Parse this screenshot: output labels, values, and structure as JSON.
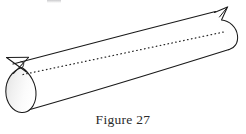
{
  "figure": {
    "caption": "Figure 27",
    "caption_number": "27",
    "caption_label": "Figure",
    "background_color": "#ffffff",
    "stroke_color": "#1a1a1a",
    "dotted_stroke_color": "#2a2a2a",
    "end_cap_fill_light": "#ffffff",
    "end_cap_fill_shade": "#e8e8e8",
    "elements": {
      "top_edge": "top-slant-line",
      "bottom_edge": "bottom-slant-line",
      "axis": "dotted-center-axis",
      "near_end": "shaded-teardrop-end-cap",
      "far_end": "curved-far-end-cap",
      "near_cusp": "left-bowtie-cusp",
      "far_cusp": "right-bowtie-cusp"
    }
  },
  "geometry": {
    "top_edge_start": "11,64",
    "top_edge_end": "226,8",
    "bottom_edge_start": "22,112",
    "bottom_edge_end": "237,47",
    "axis_start": "24,75",
    "axis_end": "227,33",
    "near_cap_center": "24,90",
    "near_cap_width": "34",
    "near_cap_height": "48",
    "far_cap_center": "228,30",
    "far_cap_width": "24",
    "far_cap_height": "44"
  }
}
